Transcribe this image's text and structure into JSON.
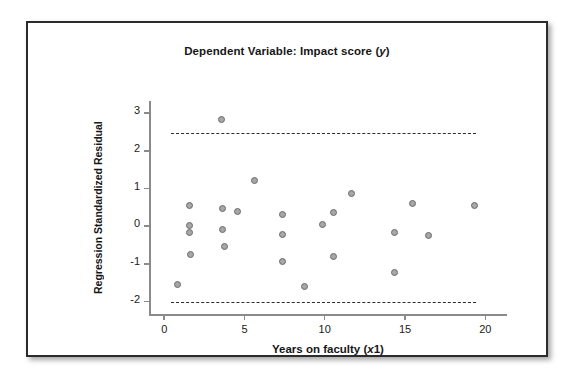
{
  "chart_data": {
    "type": "scatter",
    "title": "Dependent Variable: Impact score (y)",
    "title_plain": "Dependent Variable: Impact score",
    "title_italic_var": "y",
    "xlabel": "Years on faculty (x1)",
    "xlabel_plain": "Years on faculty",
    "xlabel_italic_var": "x",
    "xlabel_sub": "1",
    "ylabel": "Regression Standardized Residual",
    "xlim": [
      -0.9,
      21.4
    ],
    "ylim": [
      -2.35,
      3.3
    ],
    "xticks": [
      0,
      5,
      10,
      15,
      20
    ],
    "xtick_labels": [
      "0",
      "5",
      "10",
      "15",
      "20"
    ],
    "yticks": [
      -2,
      -1,
      0,
      1,
      2,
      3
    ],
    "ytick_labels": [
      "-2",
      "-1",
      "0",
      "1",
      "2",
      "3"
    ],
    "grid": false,
    "legend": "none",
    "marker": {
      "shape": "circle",
      "fill_color": "#a6a6a6",
      "edge_color": "#6b6b6b",
      "size_px": 7
    },
    "reference_lines": [
      {
        "name": "upper-limit",
        "orientation": "horizontal",
        "y": 2.44,
        "x_start": 0.5,
        "x_end": 19.5,
        "style": "dashed",
        "color": "#2d2d2d"
      },
      {
        "name": "lower-limit",
        "orientation": "horizontal",
        "y": -2.02,
        "x_start": 0.5,
        "x_end": 19.5,
        "style": "dashed",
        "color": "#2d2d2d"
      }
    ],
    "points": [
      {
        "x": 0.9,
        "y": -1.57
      },
      {
        "x": 1.6,
        "y": 0.52
      },
      {
        "x": 1.6,
        "y": 0.0
      },
      {
        "x": 1.6,
        "y": -0.2
      },
      {
        "x": 1.7,
        "y": -0.78
      },
      {
        "x": 3.6,
        "y": 2.82
      },
      {
        "x": 3.7,
        "y": 0.45
      },
      {
        "x": 3.7,
        "y": -0.1
      },
      {
        "x": 3.8,
        "y": -0.56
      },
      {
        "x": 4.6,
        "y": 0.38
      },
      {
        "x": 5.7,
        "y": 1.2
      },
      {
        "x": 7.4,
        "y": 0.28
      },
      {
        "x": 7.4,
        "y": -0.24
      },
      {
        "x": 7.4,
        "y": -0.95
      },
      {
        "x": 8.8,
        "y": -1.62
      },
      {
        "x": 9.9,
        "y": 0.02
      },
      {
        "x": 10.6,
        "y": 0.35
      },
      {
        "x": 10.6,
        "y": -0.82
      },
      {
        "x": 11.7,
        "y": 0.85
      },
      {
        "x": 14.4,
        "y": -0.2
      },
      {
        "x": 14.4,
        "y": -1.26
      },
      {
        "x": 15.5,
        "y": 0.58
      },
      {
        "x": 16.5,
        "y": -0.28
      },
      {
        "x": 19.4,
        "y": 0.52
      }
    ]
  }
}
